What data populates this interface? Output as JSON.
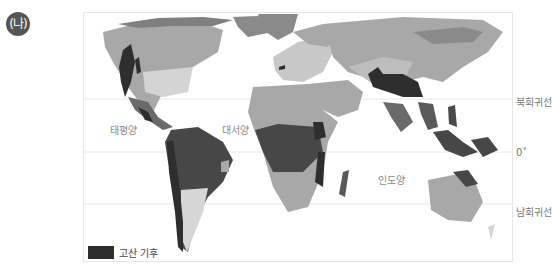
{
  "panel_label": "(나)",
  "map": {
    "type": "world climate map",
    "highlight_color": "#2e2e2e",
    "oceans": [
      {
        "name": "태평양"
      },
      {
        "name": "대서양"
      },
      {
        "name": "인도양"
      }
    ],
    "latitude_labels": {
      "tropic_cancer": "북회귀선",
      "equator": "0˚",
      "tropic_capricorn": "남회귀선"
    },
    "legend": {
      "label": "고산 기후",
      "color": "#2e2e2e"
    }
  }
}
